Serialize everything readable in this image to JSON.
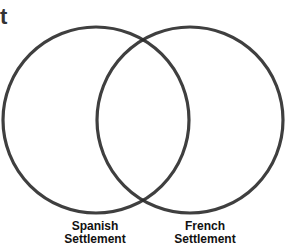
{
  "title_fragment": "t",
  "diagram": {
    "type": "venn",
    "circles": [
      {
        "name": "Spanish Settlement",
        "label_line1": "Spanish",
        "label_line2": "Settlement"
      },
      {
        "name": "French Settlement",
        "label_line1": "French",
        "label_line2": "Settlement"
      }
    ],
    "stroke_color": "#2a2a2a"
  }
}
